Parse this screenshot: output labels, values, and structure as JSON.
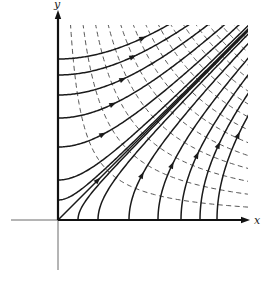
{
  "diagram": {
    "axes": {
      "x_label": "x",
      "y_label": "y",
      "origin_px": [
        58,
        220
      ],
      "x_end_px": 250,
      "y_end_px": 8,
      "neg_x_start_px": 11,
      "neg_y_end_px": 270
    },
    "region": {
      "width_px": 190,
      "height_px": 195
    },
    "streamlines": {
      "style": "solid",
      "color": "#1a1a1a",
      "description": "hyperbolas x^2 - y^2 = c (lower family) and y^2 - x^2 = c (upper family) plus diagonal y = x",
      "lower_family_x_intercepts_px": [
        71,
        100,
        123,
        142,
        159
      ],
      "upper_family_y_intercepts_px": [
        73,
        102,
        125,
        145,
        161
      ],
      "extra_upper_intercepts_px": [
        40,
        20
      ],
      "extra_lower_intercepts_px": [
        40,
        20
      ],
      "diagonal": true,
      "arrow_direction": "away from axes toward upper right"
    },
    "equipotentials": {
      "style": "dashed",
      "color": "#555555",
      "description": "hyperbolas xy = c",
      "c_values": [
        2450,
        4900,
        7350,
        9800,
        12250,
        14700,
        17150,
        19600,
        22050,
        24500,
        26950,
        29400,
        31850,
        34300
      ]
    }
  }
}
